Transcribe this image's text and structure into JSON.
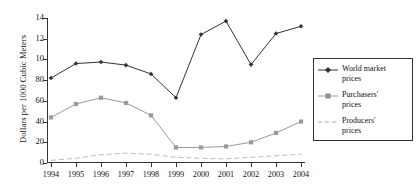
{
  "chart_data": {
    "type": "line",
    "title": "",
    "xlabel": "",
    "ylabel": "Dollars per 1000 Cubic Meters",
    "x": [
      1994,
      1995,
      1996,
      1997,
      1998,
      1999,
      2000,
      2001,
      2002,
      2003,
      2004
    ],
    "xtick_labels": [
      "1994",
      "1995",
      "1996",
      "1997",
      "1998",
      "1999",
      "2000",
      "2001",
      "2002",
      "2003",
      "2004"
    ],
    "ytick_labels": [
      "0",
      "20",
      "40",
      "60",
      "80",
      "10",
      "12",
      "14"
    ],
    "ytick_values": [
      0,
      2,
      4,
      6,
      8,
      10,
      12,
      14
    ],
    "ylim": [
      0,
      14
    ],
    "grid": false,
    "legend_position": "right",
    "series": [
      {
        "name": "World market prices",
        "marker": "diamond",
        "linestyle": "solid",
        "color": "#333333",
        "values": [
          8.2,
          9.6,
          9.75,
          9.45,
          8.6,
          6.3,
          12.4,
          13.7,
          9.5,
          12.5,
          13.2
        ]
      },
      {
        "name": "Purchasers' prices",
        "marker": "square",
        "linestyle": "solid",
        "color": "#9a9a9a",
        "values": [
          4.4,
          5.7,
          6.3,
          5.8,
          4.6,
          1.5,
          1.5,
          1.6,
          2.0,
          2.9,
          4.0
        ]
      },
      {
        "name": "Producers' prices",
        "marker": "none",
        "linestyle": "dashed",
        "color": "#b0b0b0",
        "values": [
          0.25,
          0.45,
          0.8,
          0.95,
          0.85,
          0.55,
          0.45,
          0.4,
          0.55,
          0.7,
          0.85
        ]
      }
    ]
  },
  "legend": {
    "items": [
      {
        "label_line1": "World market",
        "label_line2": "prices"
      },
      {
        "label_line1": "Purchasers'",
        "label_line2": "prices"
      },
      {
        "label_line1": "Producers'",
        "label_line2": "prices"
      }
    ]
  }
}
